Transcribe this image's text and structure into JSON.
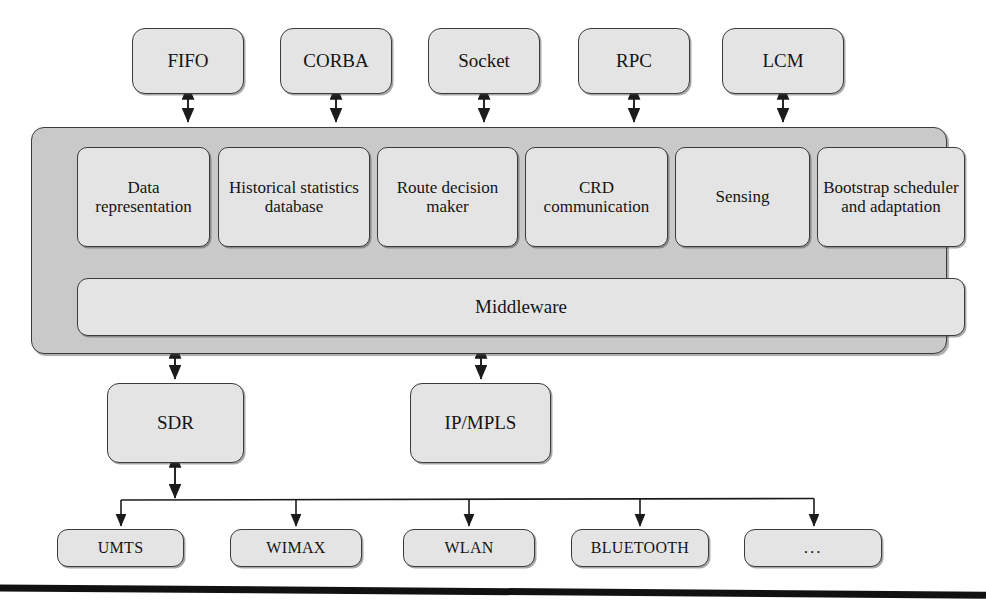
{
  "diagram": {
    "colors": {
      "panel_fill": "#c9c9c9",
      "box_fill": "#e4e4e4",
      "stroke": "#3b3b3b",
      "text": "#141414",
      "background": "#ffffff",
      "rule": "#111111"
    }
  },
  "protocol_row": {
    "name": "ipc-protocols",
    "items": [
      {
        "label": "FIFO",
        "x": 132,
        "width": 112
      },
      {
        "label": "CORBA",
        "x": 280,
        "width": 112
      },
      {
        "label": "Socket",
        "x": 428,
        "width": 112
      },
      {
        "label": "RPC",
        "x": 578,
        "width": 112
      },
      {
        "label": "LCM",
        "x": 722,
        "width": 122
      }
    ]
  },
  "panel": {
    "name": "cognitive-engine-panel",
    "components": [
      {
        "label": "Data representation",
        "x": 45,
        "width": 133
      },
      {
        "label": "Historical statistics database",
        "x": 186,
        "width": 152
      },
      {
        "label": "Route decision maker",
        "x": 345,
        "width": 141
      },
      {
        "label": "CRD communication",
        "x": 493,
        "width": 143
      },
      {
        "label": "Sensing",
        "x": 643,
        "width": 135
      },
      {
        "label": "Bootstrap scheduler and adaptation",
        "x": 785,
        "width": 148
      }
    ],
    "middleware": {
      "label": "Middleware",
      "x": 45,
      "width": 888
    }
  },
  "transport_row": {
    "name": "transport-layer",
    "items": [
      {
        "label": "SDR",
        "x": 107,
        "width": 137
      },
      {
        "label": "IP/MPLS",
        "x": 410,
        "width": 141
      }
    ]
  },
  "access_row": {
    "name": "access-technologies",
    "items": [
      {
        "label": "UMTS",
        "x": 57,
        "width": 127
      },
      {
        "label": "WIMAX",
        "x": 230,
        "width": 132
      },
      {
        "label": "WLAN",
        "x": 403,
        "width": 132
      },
      {
        "label": "BLUETOOTH",
        "x": 571,
        "width": 138
      },
      {
        "label": "...",
        "x": 744,
        "width": 138
      }
    ]
  },
  "connectors": {
    "protocol_to_panel": {
      "name": "bidirectional-arrows-protocols",
      "x_positions": [
        188,
        336,
        484,
        634,
        783
      ],
      "y_top": 94,
      "y_bottom": 127
    },
    "component_to_middleware": {
      "name": "bidirectional-arrows-components",
      "x_positions": [
        111,
        262,
        415,
        564,
        710,
        859
      ],
      "y_top": 246,
      "y_bottom": 277
    },
    "panel_to_sdr": {
      "name": "bidirectional-arrow-sdr",
      "x": 175,
      "y_top": 354,
      "y_bottom": 383
    },
    "panel_to_ipmpls": {
      "name": "bidirectional-arrow-ipmpls",
      "x": 481,
      "y_top": 354,
      "y_bottom": 383
    },
    "sdr_to_bus": {
      "name": "bidirectional-arrow-sdr-bus",
      "x": 175,
      "y_top": 463,
      "y_bottom": 500
    },
    "bus": {
      "name": "access-bus-line",
      "y": 500,
      "x_start": 121,
      "x_end": 814,
      "drops": [
        121,
        296,
        469,
        640,
        814
      ],
      "y_drop_end": 529
    }
  }
}
